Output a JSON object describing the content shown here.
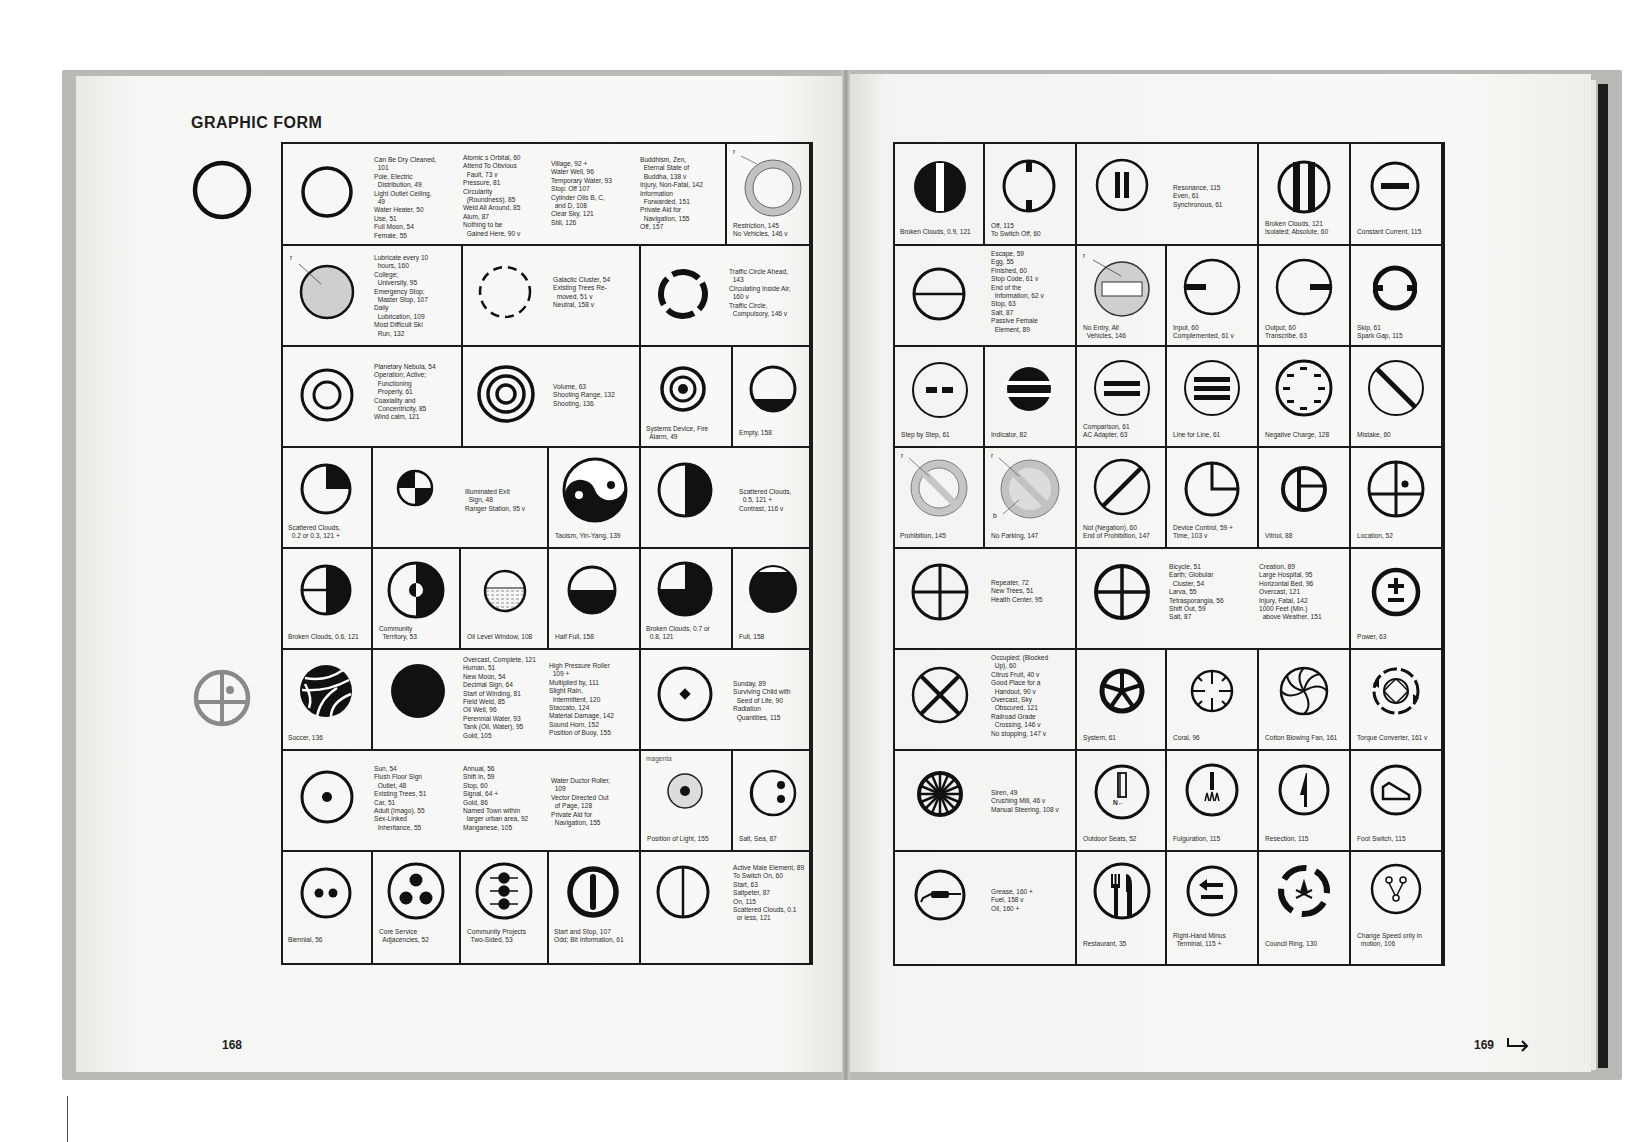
{
  "book": {
    "section_title": "GRAPHIC FORM",
    "left_page_number": "168",
    "right_page_number": "169",
    "continue_arrow": "right-hook-arrow"
  },
  "left_page": {
    "margin_icons": [
      "plain-circle-icon",
      "circle-with-cross-and-dot-icon (gray)"
    ],
    "cells": [
      {
        "row": 1,
        "glyph": "plain-circle",
        "text": "",
        "cols": [
          "Can Be Dry Cleaned,\n  101\nPole, Electric\n  Distribution, 49\nLight Outlet Ceiling,\n  49\nWater Heater, 50\nUse, 51\nFull Moon, 54\nFemale, 55",
          "Atomic s Orbital, 60\nAttend To Obvious\n  Fault, 73 v\nPressure, 81\nCircularity\n  (Roundness), 85\nWeld All Around, 85\nAlum, 87\nNothing to be\n  Gained Here, 90 v",
          "Village, 92 +\nWater Well, 96\nTemporary Water, 93\nStop: Off 107\nCylinder Oils B, C,\n  and D, 108\nClear Sky, 121\nStill, 126",
          "Buddhism, Zen,\n  Eternal State of\n  Buddha, 138 v\nInjury, Non-Fatal, 142\nInformation\n  Forwarded, 151\nPrivate Aid for\n  Navigation, 155\nOff, 157"
        ]
      },
      {
        "row": 1,
        "glyph": "ring-gray-restriction",
        "label_r": "r",
        "text": "Restriction, 145\nNo Vehicles, 146 v"
      },
      {
        "row": 2,
        "glyph": "gray-filled-circle",
        "label_r": "r",
        "text": "Lubricate every 10\n  hours, 160\nCollege;\n  University, 95\nEmergency Stop;\n  Master Stop, 107\nDaily\n  Lubrication, 109\nMost Difficult Ski\n  Run, 132"
      },
      {
        "row": 2,
        "glyph": "dashed-circle",
        "text": "Galactic Cluster, 54\nExisting Trees Re-\n  moved, 51 v\nNeutral, 158 v"
      },
      {
        "row": 2,
        "glyph": "four-segment-circle",
        "text": "Traffic Circle Ahead,\n  143\nCirculating Inside Air,\n  160 v\nTraffic Circle,\n  Compulsory, 146 v"
      },
      {
        "row": 3,
        "glyph": "double-ring",
        "text": "Planetary Nebula, 54\nOperation; Active;\n  Functioning\n  Properly, 61\nCoaxiality and\n  Concentricity, 85\nWind calm, 121"
      },
      {
        "row": 3,
        "glyph": "triple-ring",
        "text": "Volume, 63\nShooting Range, 132\nShooting, 136"
      },
      {
        "row": 3,
        "glyph": "target-ring-dot",
        "text": "Systems Device, Fire\n  Alarm, 49"
      },
      {
        "row": 3,
        "glyph": "circle-bottom-filled",
        "text": "Empty, 158"
      },
      {
        "row": 4,
        "glyph": "quarter-filled-circle",
        "text": "Scattered Clouds,\n  0.2 or 0.3, 121 +"
      },
      {
        "row": 4,
        "glyph": "checkered-quarters",
        "text": "Illuminated Exit\n  Sign, 48\nRanger Station, 95 v"
      },
      {
        "row": 4,
        "glyph": "yin-yang",
        "text": "Taoism, Yin-Yang, 139"
      },
      {
        "row": 4,
        "glyph": "half-filled-vertical",
        "text": "Scattered Clouds,\n  0.5, 121 +\nContrast, 116 v"
      },
      {
        "row": 5,
        "glyph": "three-quarter-filled-cross",
        "text": "Broken Clouds, 0.6, 121"
      },
      {
        "row": 5,
        "glyph": "half-filled-with-dot",
        "text": "Community\n  Territory, 53"
      },
      {
        "row": 5,
        "glyph": "oil-level-window",
        "text": "Oil Level Window, 108"
      },
      {
        "row": 5,
        "glyph": "bottom-half-filled",
        "text": "Half Full, 158"
      },
      {
        "row": 5,
        "glyph": "three-quarter-filled",
        "text": "Broken Clouds, 0.7 or\n  0.8, 121"
      },
      {
        "row": 5,
        "glyph": "nearly-full",
        "text": "Full, 158"
      },
      {
        "row": 6,
        "glyph": "volleyball",
        "text": "Soccer, 136"
      },
      {
        "row": 6,
        "glyph": "solid-disc",
        "text": "",
        "cols": [
          "Overcast, Complete, 121\nHuman, 51\nNew Moon, 54\nDecimal Sign, 64\nStart of Winding, 81\nField Weld, 85\nOil Well, 96\nPerennial Water, 93\nTank (Oil, Water), 95\nGold, 105",
          "High Pressure Roller\n  109 +\nMultiplied by, 111\nSlight Rain,\n  Intermittent, 120\nStaccato, 124\nMaterial Damage, 142\nSound Horn, 152\nPosition of Buoy, 155"
        ]
      },
      {
        "row": 6,
        "glyph": "circle-with-diamond",
        "text": "Sunday, 89\nSurviving Child with\n  Seed of Life, 90\nRadiation\n  Quantities, 115"
      },
      {
        "row": 7,
        "glyph": "circle-with-dot",
        "text": "",
        "cols": [
          "Sun, 54\nFlush Floor Sign\n  Outlet, 48\nExisting Trees, 51\nCar, 51\nAdult (Imago), 55\nSex-Linked\n  Inheritance, 55",
          "Annual, 56\nShift In, 59\nStop, 60\nSignal, 64 +\nGold, 86\nNamed Town within\n  larger urban area, 92\nManganese, 105",
          "Water Ductor Roller,\n  109\nVector Directed Out\n  of Page, 128\nPrivate Aid for\n  Navigation, 155"
        ]
      },
      {
        "row": 7,
        "glyph": "magenta-dotted-circle",
        "label_magenta": "magenta",
        "text": "Position of Light, 155"
      },
      {
        "row": 7,
        "glyph": "crescent-two-dots",
        "text": "Salt, Sea, 87"
      },
      {
        "row": 8,
        "glyph": "two-dots",
        "text": "Biennial, 56"
      },
      {
        "row": 8,
        "glyph": "three-dots",
        "text": "Core Service\n  Adjacencies, 52"
      },
      {
        "row": 8,
        "glyph": "dots-with-arrows",
        "text": "Community Projects\n  Two-Sided, 53"
      },
      {
        "row": 8,
        "glyph": "thick-circle-vertical-bar",
        "text": "Start and Stop, 107\nOdd; Bit Information, 61"
      },
      {
        "row": 8,
        "glyph": "circle-vertical-line",
        "text": "Active Male Element, 89\nTo Switch On, 60\nStart, 63\nSaltpeter, 87\nOn, 115\nScattered Clouds, 0.1\n  or less, 121"
      }
    ]
  },
  "right_page": {
    "cells": [
      {
        "row": 1,
        "glyph": "disc-with-white-bar",
        "text": "Broken Clouds, 0.9, 121"
      },
      {
        "row": 1,
        "glyph": "circle-top-bottom-ticks",
        "text": "Off, 115\nTo Switch Off, 60"
      },
      {
        "row": 1,
        "glyph": "circle-two-bars",
        "text": "Resonance, 115\nEven, 61\nSynchronous, 61"
      },
      {
        "row": 1,
        "glyph": "circle-two-thick-bars",
        "text": "Broken Clouds, 121\nIsolated; Absolute, 60"
      },
      {
        "row": 1,
        "glyph": "circle-horizontal-bar",
        "text": "Constant Current, 115"
      },
      {
        "row": 2,
        "glyph": "circle-horizontal-diameter",
        "text": "Escape, 59\nEgg, 55\nFinished, 60\nStop Code, 61 v\nEnd of the\n  Information, 62 v\nStop, 63\nSalt, 87\nPassive Female\n  Element, 89"
      },
      {
        "row": 2,
        "glyph": "no-entry",
        "label_r": "r",
        "text": "No Entry, All\n  Vehicles, 146"
      },
      {
        "row": 2,
        "glyph": "circle-left-bar",
        "text": "Input, 60\nComplemented, 61 v"
      },
      {
        "row": 2,
        "glyph": "circle-right-bar",
        "text": "Output, 60\nTranscribe, 63"
      },
      {
        "row": 2,
        "glyph": "circle-side-gaps",
        "text": "Skip, 61\nSpark Gap, 115"
      },
      {
        "row": 3,
        "glyph": "circle-two-dashes",
        "text": "Step by Step, 61"
      },
      {
        "row": 3,
        "glyph": "disc-two-white-bars",
        "text": "Indicator, 82"
      },
      {
        "row": 3,
        "glyph": "circle-equals",
        "text": "Comparison, 61\nAC Adapter, 63"
      },
      {
        "row": 3,
        "glyph": "circle-three-bars",
        "text": "Line for Line, 61"
      },
      {
        "row": 3,
        "glyph": "circle-ring-of-dashes",
        "text": "Negative Charge, 128"
      },
      {
        "row": 3,
        "glyph": "circle-diagonal-bar",
        "text": "Mistake, 60"
      },
      {
        "row": 4,
        "glyph": "prohibition-gray",
        "label_r": "r",
        "text": "Prohibition, 145"
      },
      {
        "row": 4,
        "glyph": "no-parking-gray",
        "label_r": "r",
        "label_b": "b",
        "text": "No Parking, 147"
      },
      {
        "row": 4,
        "glyph": "circle-slash",
        "text": "Not (Negation), 60\nEnd of Prohibition, 147"
      },
      {
        "row": 4,
        "glyph": "clock-quarter",
        "text": "Device Control, 59 +\nTime, 103 v"
      },
      {
        "row": 4,
        "glyph": "vitriol",
        "text": "Vitriol, 88"
      },
      {
        "row": 4,
        "glyph": "location",
        "text": "Location, 52"
      },
      {
        "row": 5,
        "glyph": "cross-circle",
        "text": "Repeater, 72\nNew Trees, 51\nHealth Center, 95"
      },
      {
        "row": 5,
        "glyph": "cross-circle-bold",
        "text": "",
        "cols": [
          "Bicycle, 51\nEarth; Globular\n  Cluster, 54\nLarva, 55\nTetrasporangia, 56\nShift Out, 59\nSalt, 87",
          "Creation, 89\nLarge Hospital, 95\nHorizontal Bed, 96\nOvercast, 121\nInjury, Fatal, 142\n1000 Feet (Min.)\n  above Weather, 151"
        ]
      },
      {
        "row": 5,
        "glyph": "plus-minus",
        "text": "Power, 63"
      },
      {
        "row": 6,
        "glyph": "x-circle",
        "text": "Occupied; (Blocked\n  Up), 60\nCitrus Fruit, 40 v\nGood Place for a\n  Handout, 90 v\nOvercast, Sky\n  Obscured, 121\nRailroad Grade\n  Crossing, 146 v\nNo stopping, 147 v"
      },
      {
        "row": 6,
        "glyph": "wheel-five-spokes",
        "text": "System, 61"
      },
      {
        "row": 6,
        "glyph": "circle-crosshair",
        "text": "Coral, 96"
      },
      {
        "row": 6,
        "glyph": "swirl-fan",
        "text": "Cotton Blowing Fan, 161"
      },
      {
        "row": 6,
        "glyph": "torque-converter",
        "text": "Torque Converter, 161 v"
      },
      {
        "row": 7,
        "glyph": "spoked-wheel",
        "text": "Siren, 49\nCrushing Mill, 46 v\nManual Steering, 108 v"
      },
      {
        "row": 7,
        "glyph": "outdoor-seats",
        "glyph_text": "N←",
        "text": "Outdoor Seats, 52"
      },
      {
        "row": 7,
        "glyph": "fulguration",
        "text": "Fulguration, 115"
      },
      {
        "row": 7,
        "glyph": "resection",
        "text": "Resection, 115"
      },
      {
        "row": 7,
        "glyph": "foot-switch",
        "text": "Foot Switch, 115"
      },
      {
        "row": 8,
        "glyph": "grease-gun",
        "text": "Grease, 160 +\nFuel, 158 v\nOil, 160 +"
      },
      {
        "row": 8,
        "glyph": "fork-knife",
        "text": "Restaurant, 35"
      },
      {
        "row": 8,
        "glyph": "arrow-minus",
        "text": "Right-Hand Minus\n  Terminal, 115 +"
      },
      {
        "row": 8,
        "glyph": "campfire-ring",
        "text": "Council Ring, 130"
      },
      {
        "row": 8,
        "glyph": "speed-change",
        "text": "Change Speed only in\n  motion, 106"
      }
    ]
  }
}
